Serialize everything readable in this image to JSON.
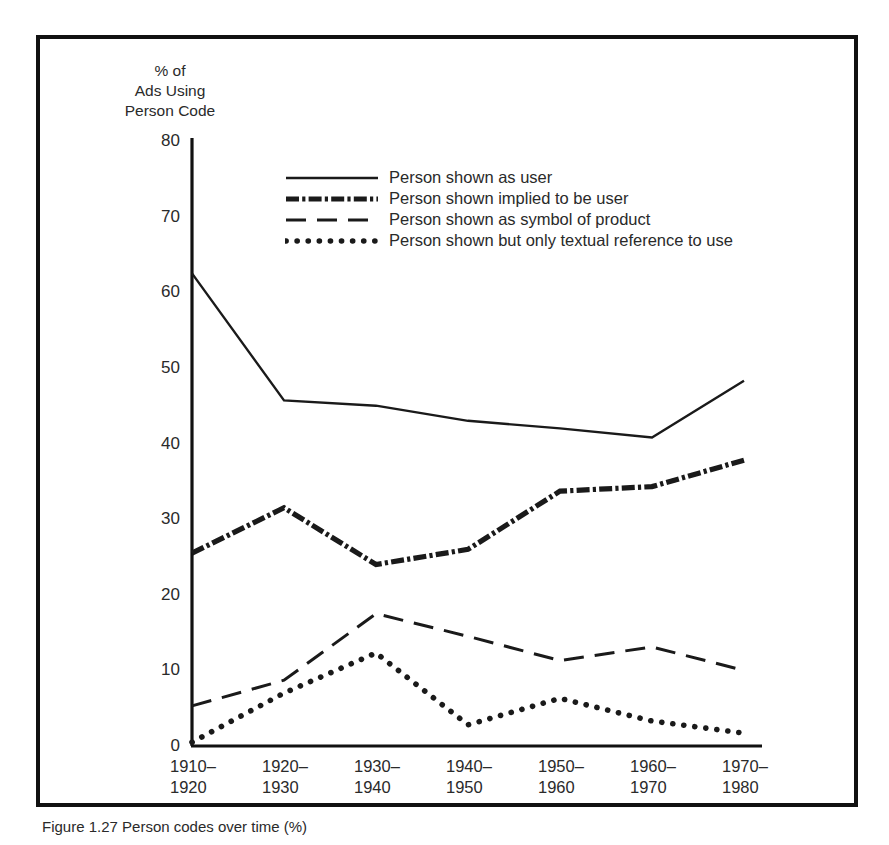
{
  "figure": {
    "caption": "Figure 1.27   Person codes over time (%)",
    "frame_color": "#111111",
    "background": "#ffffff"
  },
  "axes": {
    "y_title": "% of\nAds Using\nPerson Code",
    "y_ticks": [
      "0",
      "10",
      "20",
      "30",
      "40",
      "50",
      "60",
      "70",
      "80"
    ],
    "x_ticks": [
      "1910–\n1920",
      "1920–\n1930",
      "1930–\n1940",
      "1940–\n1950",
      "1950–\n1960",
      "1960–\n1970",
      "1970–\n1980"
    ]
  },
  "legend": {
    "items": [
      {
        "label": "Person shown as user",
        "style": "solid"
      },
      {
        "label": "Person shown implied to be user",
        "style": "dash-dot"
      },
      {
        "label": "Person shown as symbol of product",
        "style": "dashed"
      },
      {
        "label": "Person shown but only textual reference to use",
        "style": "dotted"
      }
    ]
  },
  "chart_data": {
    "type": "line",
    "title": "",
    "xlabel": "",
    "ylabel": "% of Ads Using Person Code",
    "ylim": [
      0,
      80
    ],
    "ytick_step": 10,
    "grid": false,
    "legend_position": "top-center-inside",
    "categories": [
      "1910–1920",
      "1920–1930",
      "1930–1940",
      "1940–1950",
      "1950–1960",
      "1960–1970",
      "1970–1980"
    ],
    "series": [
      {
        "name": "Person shown as user",
        "style": "solid",
        "color": "#1a1a1a",
        "values": [
          62.5,
          45.7,
          45.0,
          43.0,
          42.0,
          40.8,
          48.3
        ]
      },
      {
        "name": "Person shown implied to be user",
        "style": "dash-dot",
        "color": "#1a1a1a",
        "values": [
          25.5,
          31.5,
          24.0,
          26.0,
          33.7,
          34.3,
          37.8
        ]
      },
      {
        "name": "Person shown as symbol of product",
        "style": "dashed",
        "color": "#1a1a1a",
        "values": [
          5.3,
          8.7,
          17.5,
          14.5,
          11.3,
          13.1,
          10.0
        ]
      },
      {
        "name": "Person shown but only textual reference to use",
        "style": "dotted",
        "color": "#1a1a1a",
        "values": [
          0.5,
          7.0,
          12.3,
          2.8,
          6.3,
          3.3,
          1.7
        ]
      }
    ]
  }
}
